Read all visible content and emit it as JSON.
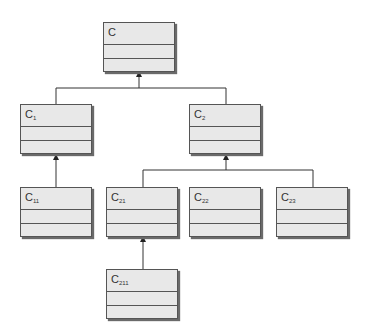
{
  "diagram": {
    "type": "uml-class-inheritance-hierarchy",
    "classes": [
      {
        "id": "C",
        "base": "C",
        "sub": "",
        "parent": null
      },
      {
        "id": "C1",
        "base": "C",
        "sub": "1",
        "parent": "C"
      },
      {
        "id": "C2",
        "base": "C",
        "sub": "2",
        "parent": "C"
      },
      {
        "id": "C11",
        "base": "C",
        "sub": "11",
        "parent": "C1"
      },
      {
        "id": "C21",
        "base": "C",
        "sub": "21",
        "parent": "C2"
      },
      {
        "id": "C22",
        "base": "C",
        "sub": "22",
        "parent": "C2"
      },
      {
        "id": "C23",
        "base": "C",
        "sub": "23",
        "parent": "C2"
      },
      {
        "id": "C211",
        "base": "C",
        "sub": "211",
        "parent": "C21"
      }
    ],
    "colors": {
      "box_fill": "#e8e8e8",
      "line": "#333333",
      "shadow": "#6a6a6a"
    }
  }
}
